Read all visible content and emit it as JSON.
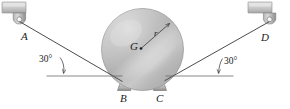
{
  "figure": {
    "type": "engineering-statics-free-body-diagram",
    "width": 290,
    "height": 109,
    "background": "#ffffff"
  },
  "labels": {
    "anchor_left": "A",
    "anchor_right": "D",
    "support_left": "B",
    "support_right": "C",
    "center_of_gravity": "G",
    "radius": "r",
    "angle_left": "30°",
    "angle_right": "30°"
  },
  "geometry": {
    "sphere": {
      "cx": 142.5,
      "cy": 49.5,
      "r": 41.0
    },
    "center_dot": {
      "x": 141.0,
      "y": 48.5,
      "r": 1.3
    },
    "radius_arrow": {
      "x1": 141.0,
      "y1": 48.5,
      "x2": 170.5,
      "y2": 22.5
    },
    "cable_left": {
      "x1": 19.5,
      "y1": 21.5,
      "x2": 121.0,
      "y2": 80.0
    },
    "cable_right": {
      "x1": 269.5,
      "y1": 21.5,
      "x2": 166.0,
      "y2": 79.5
    },
    "horizontal_left": {
      "x1": 47.0,
      "y1": 76.0,
      "x2": 122.0,
      "y2": 76.0
    },
    "horizontal_right": {
      "x1": 166.0,
      "y1": 76.0,
      "x2": 233.0,
      "y2": 76.0
    },
    "bracket_left": {
      "x": 2.0,
      "y": 2.0,
      "w": 24.0,
      "h": 11.0
    },
    "bracket_right": {
      "x": 248.0,
      "y": 2.0,
      "w": 24.0,
      "h": 11.0
    },
    "clevis_left": {
      "x": 13.0,
      "y": 13.0,
      "w": 13.0,
      "h": 11.0
    },
    "clevis_right": {
      "x": 263.0,
      "y": 13.0,
      "w": 13.0,
      "h": 11.0
    },
    "support_block_left": {
      "x": 117.0,
      "y": 84.0,
      "w": 13.0,
      "h": 7.0
    },
    "support_block_right": {
      "x": 153.0,
      "y": 84.0,
      "w": 13.0,
      "h": 7.0
    },
    "angle_vertex_left": {
      "x": 63.0,
      "y": 75.0
    },
    "angle_vertex_right": {
      "x": 218.0,
      "y": 75.0
    }
  },
  "colors": {
    "line": "#5a5a5a",
    "line_dark": "#3a3a3a",
    "sphere_light": "#e9e9e9",
    "sphere_mid": "#c9c9c9",
    "sphere_dark": "#a8a8a8",
    "bracket_light": "#dcdcdc",
    "bracket_mid": "#bdbdbd",
    "bracket_dark": "#9a9a9a",
    "text": "#1a1a1a"
  }
}
